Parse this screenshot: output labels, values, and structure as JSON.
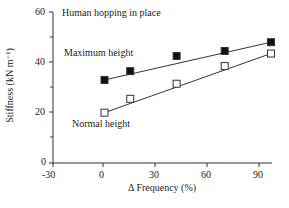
{
  "chart_data": {
    "type": "line",
    "title": "Human hopping in place",
    "xlabel": "Δ Frequency (%)",
    "ylabel": "Stiffness (kN m⁻¹)",
    "xlim": [
      -30,
      100
    ],
    "ylim": [
      0,
      60
    ],
    "xticks": [
      "-30",
      "0",
      "30",
      "60",
      "90"
    ],
    "yticks": [
      "0",
      "20",
      "40",
      "60"
    ],
    "grid": false,
    "series": [
      {
        "name": "Maximum height",
        "marker": "filled-square",
        "x": [
          0,
          15,
          42,
          70,
          97
        ],
        "values": [
          33,
          36.5,
          42.5,
          44.5,
          48
        ]
      },
      {
        "name": "Normal height",
        "marker": "open-square",
        "x": [
          0,
          15,
          42,
          70,
          97
        ],
        "values": [
          20,
          25.5,
          31.5,
          38.5,
          43.5
        ]
      }
    ],
    "annotations": [
      "Maximum height",
      "Normal height"
    ]
  }
}
